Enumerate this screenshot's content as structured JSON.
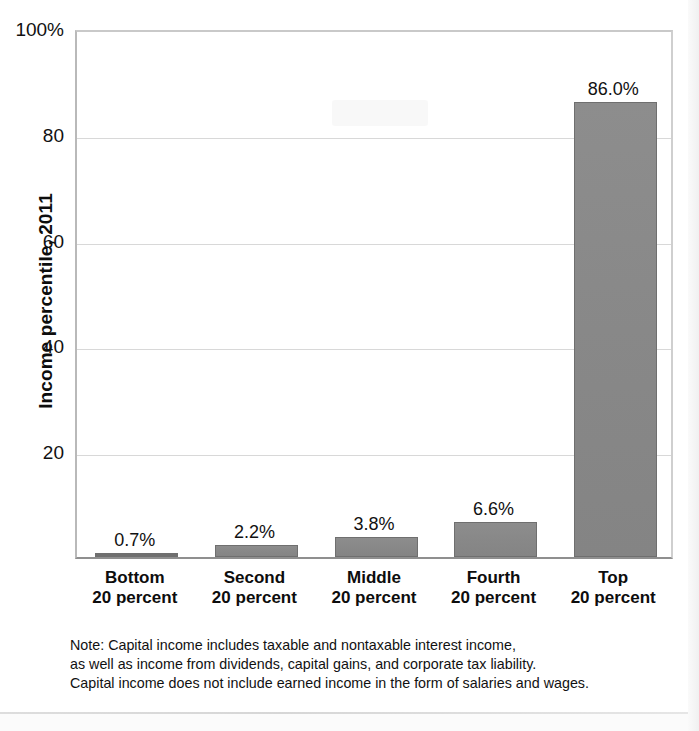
{
  "chart_data": {
    "type": "bar",
    "title": "",
    "xlabel": "",
    "ylabel": "Income percentile, 2011",
    "ylim": [
      0,
      100
    ],
    "ytick_labels": [
      "100%",
      "80",
      "60",
      "40",
      "20"
    ],
    "ytick_values": [
      100,
      80,
      60,
      40,
      20
    ],
    "grid": true,
    "legend": "none",
    "bar_color": "#888888",
    "categories": [
      "Bottom\n20 percent",
      "Second\n20 percent",
      "Middle\n20 percent",
      "Fourth\n20 percent",
      "Top\n20 percent"
    ],
    "category_lines": [
      [
        "Bottom",
        "20 percent"
      ],
      [
        "Second",
        "20 percent"
      ],
      [
        "Middle",
        "20 percent"
      ],
      [
        "Fourth",
        "20 percent"
      ],
      [
        "Top",
        "20 percent"
      ]
    ],
    "values": [
      0.7,
      2.2,
      3.8,
      6.6,
      86.0
    ],
    "value_labels": [
      "0.7%",
      "2.2%",
      "3.8%",
      "6.6%",
      "86.0%"
    ]
  },
  "note": {
    "lines": [
      "Note: Capital income includes taxable and nontaxable interest income,",
      "as well as income from dividends, capital gains, and corporate tax liability.",
      "Capital income does not include earned income in the form of salaries and wages."
    ]
  }
}
